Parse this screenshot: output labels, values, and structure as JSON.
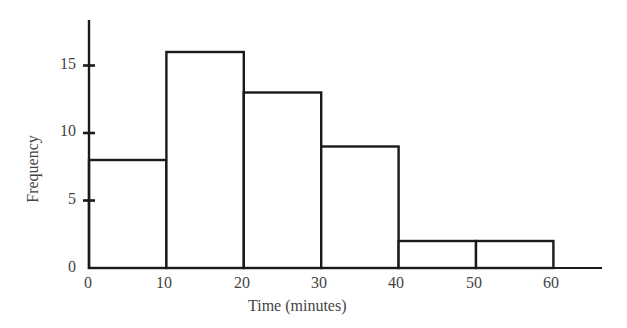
{
  "chart_data": {
    "type": "bar",
    "subtype": "histogram",
    "title": "",
    "xlabel": "Time (minutes)",
    "ylabel": "Frequency",
    "bins": [
      [
        0,
        10
      ],
      [
        10,
        20
      ],
      [
        20,
        30
      ],
      [
        30,
        40
      ],
      [
        40,
        50
      ],
      [
        50,
        60
      ]
    ],
    "categories": [
      "0-10",
      "10-20",
      "20-30",
      "30-40",
      "40-50",
      "50-60"
    ],
    "values": [
      8,
      16,
      13,
      9,
      2,
      2
    ],
    "x_ticks": [
      0,
      10,
      20,
      30,
      40,
      50,
      60
    ],
    "y_ticks": [
      0,
      5,
      10,
      15
    ],
    "xlim": [
      0,
      67
    ],
    "ylim": [
      0,
      18
    ],
    "grid": false,
    "legend": null
  },
  "labels": {
    "xlabel": "Time (minutes)",
    "ylabel": "Frequency",
    "x_ticks": [
      "0",
      "10",
      "20",
      "30",
      "40",
      "50",
      "60"
    ],
    "y_ticks": [
      "0",
      "5",
      "10",
      "15"
    ]
  }
}
